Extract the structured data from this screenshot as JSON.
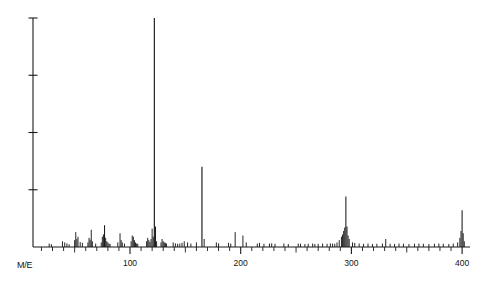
{
  "figure": {
    "kind": "mass-spectrum",
    "background_color": "#ffffff",
    "ink_color": "#1a1a1a"
  },
  "axes": {
    "x_caption": "M/E",
    "y_caption": "",
    "x_tick_labels": [
      "100",
      "200",
      "300",
      "400"
    ],
    "x_tick_values": [
      100,
      200,
      300,
      400
    ],
    "x_minor_tick_step": 10,
    "y_tick_count": 4
  },
  "chart_data": {
    "type": "bar",
    "title": "",
    "subtitle": "",
    "xlabel": "M/E",
    "ylabel": "",
    "xlim": [
      20,
      420
    ],
    "ylim": [
      0,
      100
    ],
    "grid": false,
    "legend": false,
    "legend_position": "none",
    "x_ticks": [
      100,
      200,
      300,
      400
    ],
    "x_tick_labels": [
      "100",
      "200",
      "300",
      "400"
    ],
    "x_minor_tick_step": 10,
    "y_ticks": [
      25,
      50,
      75,
      100
    ],
    "y_tick_labels": [
      "",
      "",
      "",
      ""
    ],
    "annotations": [],
    "series": [
      {
        "name": "relative intensity",
        "x": [
          27,
          29,
          39,
          41,
          43,
          45,
          50,
          51,
          52,
          53,
          55,
          57,
          62,
          63,
          64,
          65,
          66,
          69,
          74,
          75,
          76,
          77,
          78,
          79,
          80,
          81,
          82,
          89,
          91,
          92,
          93,
          95,
          101,
          102,
          103,
          104,
          105,
          106,
          107,
          115,
          116,
          117,
          118,
          119,
          120,
          121,
          122,
          123,
          124,
          128,
          129,
          130,
          131,
          132,
          133,
          139,
          141,
          143,
          145,
          147,
          149,
          152,
          155,
          160,
          165,
          167,
          178,
          180,
          189,
          191,
          195,
          202,
          205,
          215,
          217,
          221,
          226,
          228,
          231,
          239,
          243,
          252,
          254,
          258,
          261,
          265,
          267,
          270,
          274,
          278,
          281,
          283,
          285,
          287,
          289,
          291,
          292,
          293,
          294,
          295,
          296,
          297,
          298,
          301,
          303,
          307,
          311,
          315,
          319,
          323,
          328,
          331,
          335,
          339,
          343,
          347,
          352,
          357,
          361,
          365,
          370,
          375,
          379,
          383,
          388,
          392,
          396,
          398,
          399,
          400,
          401,
          402
        ],
        "values": [
          1.5,
          1.2,
          2.5,
          2.0,
          1.6,
          1.2,
          3.0,
          6.5,
          3.5,
          4.5,
          2.2,
          1.8,
          2.0,
          4.0,
          3.2,
          7.5,
          2.5,
          1.5,
          2.0,
          4.5,
          5.5,
          9.5,
          4.0,
          2.5,
          2.0,
          1.5,
          1.3,
          2.0,
          6.0,
          3.0,
          2.0,
          1.5,
          2.5,
          5.0,
          4.5,
          3.0,
          2.0,
          1.5,
          1.4,
          2.5,
          4.0,
          3.0,
          2.2,
          3.5,
          8.0,
          4.5,
          100.0,
          9.0,
          2.5,
          2.0,
          3.5,
          2.5,
          2.0,
          1.8,
          1.5,
          2.0,
          1.6,
          1.4,
          1.5,
          1.8,
          2.5,
          2.0,
          1.5,
          2.0,
          35.0,
          3.5,
          2.0,
          1.6,
          1.8,
          1.5,
          6.5,
          5.0,
          2.0,
          1.5,
          1.8,
          1.4,
          1.5,
          1.6,
          1.4,
          1.5,
          1.3,
          1.5,
          1.4,
          1.3,
          1.4,
          1.5,
          1.3,
          1.4,
          1.5,
          1.4,
          1.6,
          1.5,
          1.4,
          2.0,
          3.0,
          4.5,
          5.5,
          7.0,
          8.5,
          22.0,
          9.0,
          5.0,
          3.5,
          2.0,
          1.8,
          1.5,
          1.4,
          1.5,
          1.3,
          1.4,
          1.5,
          3.5,
          1.4,
          1.3,
          1.5,
          1.4,
          1.3,
          1.4,
          1.5,
          1.4,
          1.3,
          1.4,
          1.5,
          1.4,
          1.3,
          1.5,
          2.0,
          4.0,
          7.0,
          16.0,
          6.0,
          2.5
        ]
      }
    ]
  }
}
